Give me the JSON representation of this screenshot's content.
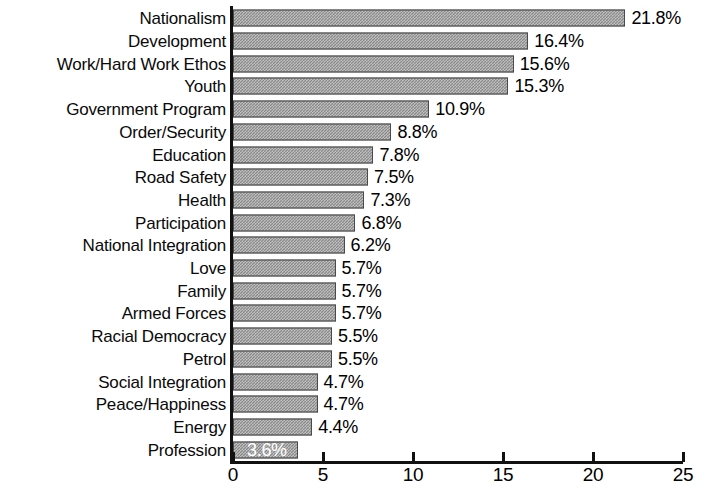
{
  "chart_data": {
    "type": "bar",
    "orientation": "horizontal",
    "title": "",
    "subtitle": "",
    "xlabel": "",
    "ylabel": "",
    "xlim": [
      0,
      25
    ],
    "xticks": [
      0,
      5,
      10,
      15,
      20,
      25
    ],
    "xtick_labels": [
      "0",
      "5",
      "10",
      "15",
      "20",
      "25"
    ],
    "grid": false,
    "legend": null,
    "value_suffix": "%",
    "bar_color": "#8a8a8a",
    "bar_edge_color": "#4a4a4a",
    "axis_color": "#111111",
    "background_color": "#ffffff",
    "inside_label_color": "#ffffff",
    "categories": [
      "Nationalism",
      "Development",
      "Work/Hard Work Ethos",
      "Youth",
      "Government Program",
      "Order/Security",
      "Education",
      "Road Safety",
      "Health",
      "Participation",
      "National Integration",
      "Love",
      "Family",
      "Armed Forces",
      "Racial Democracy",
      "Petrol",
      "Social Integration",
      "Peace/Happiness",
      "Energy",
      "Profession"
    ],
    "values": [
      21.8,
      16.4,
      15.6,
      15.3,
      10.9,
      8.8,
      7.8,
      7.5,
      7.3,
      6.8,
      6.2,
      5.7,
      5.7,
      5.7,
      5.5,
      5.5,
      4.7,
      4.7,
      4.4,
      3.6
    ],
    "data_labels": [
      "21.8%",
      "16.4%",
      "15.6%",
      "15.3%",
      "10.9%",
      "8.8%",
      "7.8%",
      "7.5%",
      "7.3%",
      "6.8%",
      "6.2%",
      "5.7%",
      "5.7%",
      "5.7%",
      "5.5%",
      "5.5%",
      "4.7%",
      "4.7%",
      "4.4%",
      "3.6%"
    ],
    "label_placement": [
      "outside",
      "outside",
      "outside",
      "outside",
      "outside",
      "outside",
      "outside",
      "outside",
      "outside",
      "outside",
      "outside",
      "outside",
      "outside",
      "outside",
      "outside",
      "outside",
      "outside",
      "outside",
      "outside",
      "inside"
    ]
  }
}
